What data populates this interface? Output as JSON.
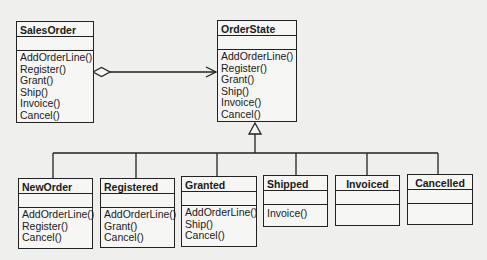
{
  "context": {
    "name": "SalesOrder",
    "operations": [
      "AddOrderLine()",
      "Register()",
      "Grant()",
      "Ship()",
      "Invoice()",
      "Cancel()"
    ]
  },
  "state": {
    "name": "OrderState",
    "operations": [
      "AddOrderLine()",
      "Register()",
      "Grant()",
      "Ship()",
      "Invoice()",
      "Cancel()"
    ]
  },
  "subclasses": [
    {
      "name": "NewOrder",
      "operations": [
        "AddOrderLine()",
        "Register()",
        "Cancel()"
      ]
    },
    {
      "name": "Registered",
      "operations": [
        "AddOrderLine()",
        "Grant()",
        "Cancel()"
      ]
    },
    {
      "name": "Granted",
      "operations": [
        "AddOrderLine()",
        "Ship()",
        "Cancel()"
      ]
    },
    {
      "name": "Shipped",
      "operations": [
        "Invoice()"
      ]
    },
    {
      "name": "Invoiced",
      "operations": []
    },
    {
      "name": "Cancelled",
      "operations": []
    }
  ],
  "relationships": [
    {
      "type": "aggregation",
      "from": "SalesOrder",
      "to": "OrderState"
    },
    {
      "type": "generalization",
      "parent": "OrderState",
      "children": [
        "NewOrder",
        "Registered",
        "Granted",
        "Shipped",
        "Invoiced",
        "Cancelled"
      ]
    }
  ]
}
